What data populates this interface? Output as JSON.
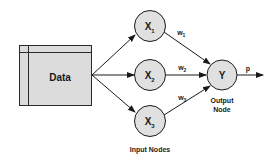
{
  "diagram": {
    "type": "perceptron",
    "data_box": {
      "label": "Data",
      "fill": "#dcdcdc",
      "stroke": "#2a2a2a"
    },
    "input_nodes": [
      {
        "id": "x1",
        "label": "X",
        "subscript": "1"
      },
      {
        "id": "x2",
        "label": "X",
        "subscript": "2"
      },
      {
        "id": "x3",
        "label": "X",
        "subscript": "3"
      }
    ],
    "input_group_label": "Input Nodes",
    "weights": [
      {
        "label": "w",
        "subscript": "1"
      },
      {
        "label": "w",
        "subscript": "2"
      },
      {
        "label": "w",
        "subscript": "3"
      }
    ],
    "output_node": {
      "label": "Y",
      "caption_line1": "Output",
      "caption_line2": "Node"
    },
    "output_arrow_label": "p",
    "colors": {
      "node_fill": "#e0e0e0",
      "stroke": "#1a1a1a",
      "background": "#ffffff"
    }
  }
}
